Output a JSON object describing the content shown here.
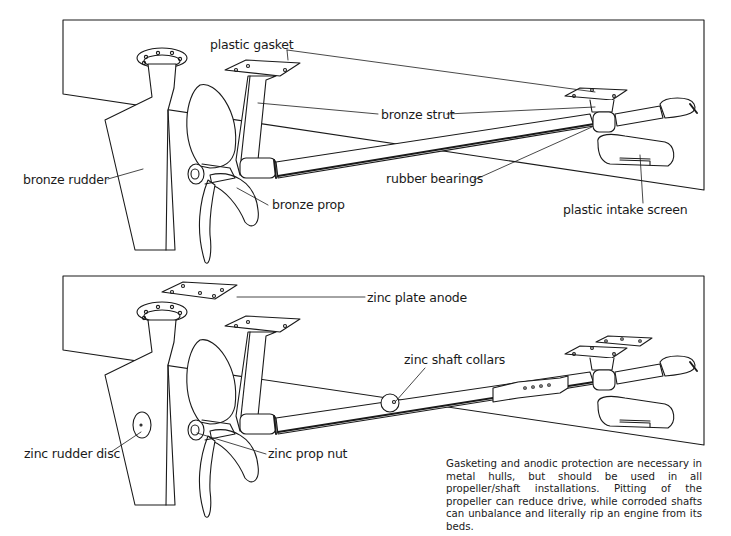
{
  "figure": {
    "top_panel": {
      "name": "bronze hardware installation",
      "labels": {
        "plastic_gasket": "plastic gasket",
        "bronze_strut": "bronze strut",
        "bronze_rudder": "bronze rudder",
        "rubber_bearings": "rubber bearings",
        "bronze_prop": "bronze prop",
        "plastic_intake_screen": "plastic intake screen"
      }
    },
    "bottom_panel": {
      "name": "zinc anode protection",
      "labels": {
        "zinc_plate_anode": "zinc plate anode",
        "zinc_shaft_collars": "zinc shaft collars",
        "zinc_rudder_disc": "zinc rudder disc",
        "zinc_prop_nut": "zinc prop nut"
      }
    },
    "caption": "Gasketing and anodic protection are necessary in metal hulls, but should be used in all propeller/shaft installations.  Pitting of the propeller can reduce drive, while corroded shafts can unbalance and literally rip an engine from its beds.",
    "colors": {
      "ink": "#1a1a1a",
      "background": "#ffffff"
    }
  }
}
